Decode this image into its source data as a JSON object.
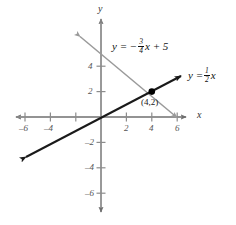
{
  "figure": {
    "type": "coordinate-plane-graph",
    "axis_labels": {
      "x": "x",
      "y": "y"
    },
    "x_ticks": [
      {
        "value": -6,
        "label": "–6"
      },
      {
        "value": -4,
        "label": "–4"
      },
      {
        "value": -2,
        "label": ""
      },
      {
        "value": 2,
        "label": "2"
      },
      {
        "value": 4,
        "label": "4"
      },
      {
        "value": 6,
        "label": "6"
      }
    ],
    "y_ticks": [
      {
        "value": 4,
        "label": "4"
      },
      {
        "value": 2,
        "label": "2"
      },
      {
        "value": -2,
        "label": "–2"
      },
      {
        "value": -4,
        "label": "–4"
      },
      {
        "value": -6,
        "label": "–6"
      }
    ],
    "lines": [
      {
        "name": "gray-line",
        "equation_text": "y = – 3/4 x + 5",
        "equation_parts": {
          "lhs": "y",
          "eq": "=",
          "sign": "−",
          "num": "3",
          "den": "4",
          "var": "x",
          "plus": "+",
          "intercept": "5"
        },
        "slope": -0.75,
        "intercept": 5,
        "color": "#9a9a9a",
        "arrows": "both"
      },
      {
        "name": "black-line",
        "equation_text": "y = 1/2 x",
        "equation_parts": {
          "lhs": "y",
          "eq": "=",
          "num": "1",
          "den": "2",
          "var": "x"
        },
        "slope": 0.5,
        "intercept": 0,
        "color": "#1a1a1a",
        "arrows": "both"
      }
    ],
    "point": {
      "label": "(4,2)",
      "x": 4,
      "y": 2,
      "color": "#000000"
    },
    "axis_color": "#8c8c8c",
    "background": "#ffffff"
  }
}
